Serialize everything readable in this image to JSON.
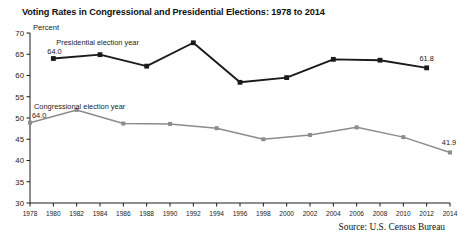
{
  "chart_data": {
    "type": "line",
    "title": "Voting Rates in Congressional and Presidential Elections: 1978 to 2014",
    "xlabel": "",
    "ylabel": "Percent",
    "ylim": [
      30,
      70
    ],
    "yticks": [
      30,
      35,
      40,
      45,
      50,
      55,
      60,
      65,
      70
    ],
    "xlim": [
      1978,
      2014
    ],
    "xticks": [
      1978,
      1980,
      1982,
      1984,
      1986,
      1988,
      1990,
      1992,
      1994,
      1996,
      1998,
      2000,
      2002,
      2004,
      2006,
      2008,
      2010,
      2012,
      2014
    ],
    "grid": false,
    "legend": "inline-annotations",
    "source": "Source: U.S. Census Bureau",
    "series": [
      {
        "name": "Presidential election year",
        "color": "#1a1a1a",
        "marker": "square",
        "annotation_label": "Presidential election year",
        "annotation_value": "64.0",
        "endpoint_label": "61.8",
        "x": [
          1980,
          1984,
          1988,
          1992,
          1996,
          2000,
          2004,
          2008,
          2012
        ],
        "values": [
          64.0,
          64.9,
          62.2,
          67.7,
          58.4,
          59.5,
          63.8,
          63.6,
          61.8
        ]
      },
      {
        "name": "Congressional election year",
        "color": "#8c8c8c",
        "marker": "square",
        "annotation_label": "Congressional election year",
        "annotation_value": "64.0",
        "endpoint_label": "41.9",
        "x": [
          1978,
          1982,
          1986,
          1990,
          1994,
          1998,
          2002,
          2006,
          2010,
          2014
        ],
        "values": [
          48.9,
          51.9,
          48.7,
          48.6,
          47.6,
          45.0,
          46.0,
          47.8,
          45.5,
          41.9
        ]
      }
    ]
  },
  "source": {
    "text": "Source: U.S. Census Bureau"
  }
}
